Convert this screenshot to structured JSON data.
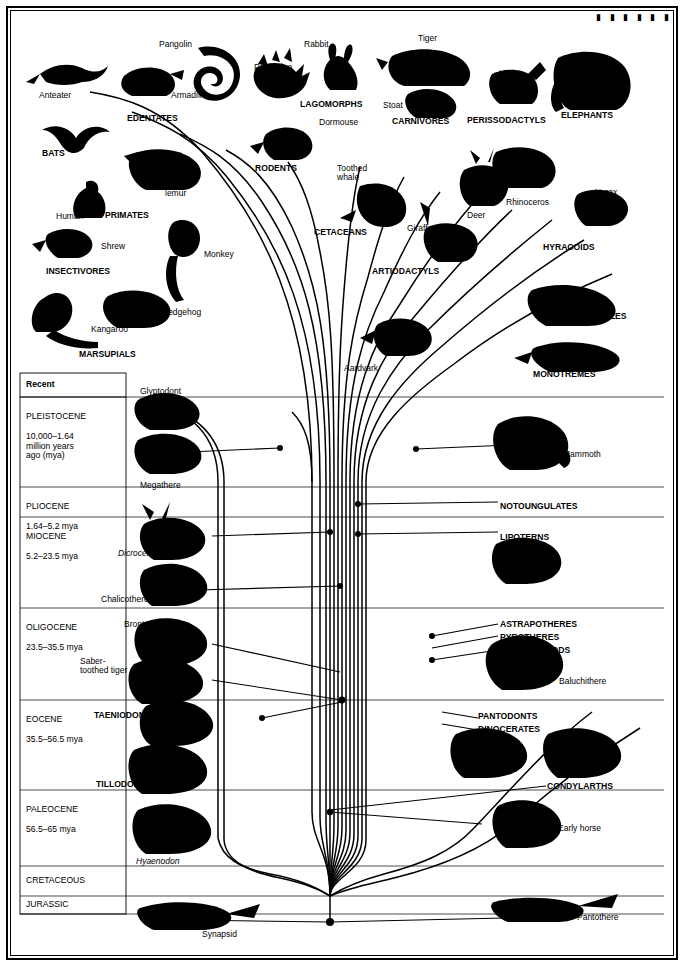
{
  "diagram": {
    "top_marks": "▮ ▮ ▮ ▮ ▮ ▮",
    "time_column": {
      "header": "Recent",
      "rows": [
        {
          "name": "PLEISTOCENE",
          "detail": "10,000–1.64\nmillion years\nago (mya)"
        },
        {
          "name": "PLIOCENE",
          "detail": "1.64–5.2 mya"
        },
        {
          "name": "MIOCENE",
          "detail": "5.2–23.5 mya"
        },
        {
          "name": "OLIGOCENE",
          "detail": "23.5–35.5 mya"
        },
        {
          "name": "EOCENE",
          "detail": "35.5–56.5 mya"
        },
        {
          "name": "PALEOCENE",
          "detail": "56.5–65 mya"
        },
        {
          "name": "CRETACEOUS",
          "detail": ""
        },
        {
          "name": "JURASSIC",
          "detail": ""
        }
      ]
    },
    "top_labels": [
      {
        "text": "Pangolin",
        "x": 147,
        "y": 28,
        "bold": false,
        "italic": false
      },
      {
        "text": "Rabbit",
        "x": 292,
        "y": 28,
        "bold": false,
        "italic": false
      },
      {
        "text": "Tiger",
        "x": 406,
        "y": 22,
        "bold": false,
        "italic": false
      },
      {
        "text": "Porcupine",
        "x": 242,
        "y": 51,
        "bold": false,
        "italic": false
      },
      {
        "text": "Horse",
        "x": 487,
        "y": 57,
        "bold": false,
        "italic": false
      },
      {
        "text": "Anteater",
        "x": 27,
        "y": 79,
        "bold": false,
        "italic": false
      },
      {
        "text": "Armadillo",
        "x": 159,
        "y": 79,
        "bold": false,
        "italic": false
      },
      {
        "text": "LAGOMORPHS",
        "x": 288,
        "y": 88,
        "bold": true,
        "italic": false
      },
      {
        "text": "Stoat",
        "x": 371,
        "y": 89,
        "bold": false,
        "italic": false
      },
      {
        "text": "ELEPHANTS",
        "x": 549,
        "y": 99,
        "bold": true,
        "italic": false
      },
      {
        "text": "EDENTATES",
        "x": 115,
        "y": 102,
        "bold": true,
        "italic": false
      },
      {
        "text": "Dormouse",
        "x": 307,
        "y": 106,
        "bold": false,
        "italic": false
      },
      {
        "text": "CARNIVORES",
        "x": 380,
        "y": 105,
        "bold": true,
        "italic": false
      },
      {
        "text": "PERISSODACTYLS",
        "x": 455,
        "y": 104,
        "bold": true,
        "italic": false
      },
      {
        "text": "BATS",
        "x": 30,
        "y": 137,
        "bold": true,
        "italic": false
      },
      {
        "text": "RODENTS",
        "x": 243,
        "y": 152,
        "bold": true,
        "italic": false
      },
      {
        "text": "Toothed\nwhale",
        "x": 325,
        "y": 152,
        "bold": false,
        "italic": false
      },
      {
        "text": "Flying\nlemur",
        "x": 153,
        "y": 168,
        "bold": false,
        "italic": false
      },
      {
        "text": "Hyrax",
        "x": 583,
        "y": 176,
        "bold": false,
        "italic": false
      },
      {
        "text": "Rhinoceros",
        "x": 494,
        "y": 186,
        "bold": false,
        "italic": false
      },
      {
        "text": "Human",
        "x": 44,
        "y": 200,
        "bold": false,
        "italic": false
      },
      {
        "text": "PRIMATES",
        "x": 93,
        "y": 199,
        "bold": true,
        "italic": false
      },
      {
        "text": "Deer",
        "x": 455,
        "y": 199,
        "bold": false,
        "italic": false
      },
      {
        "text": "CETACEANS",
        "x": 302,
        "y": 216,
        "bold": true,
        "italic": false
      },
      {
        "text": "Giraffe",
        "x": 395,
        "y": 212,
        "bold": false,
        "italic": false
      },
      {
        "text": "Shrew",
        "x": 89,
        "y": 230,
        "bold": false,
        "italic": false
      },
      {
        "text": "HYRACOIDS",
        "x": 531,
        "y": 231,
        "bold": true,
        "italic": false
      },
      {
        "text": "Monkey",
        "x": 192,
        "y": 238,
        "bold": false,
        "italic": false
      },
      {
        "text": "INSECTIVORES",
        "x": 34,
        "y": 255,
        "bold": true,
        "italic": false
      },
      {
        "text": "ARTIODACTYLS",
        "x": 360,
        "y": 255,
        "bold": true,
        "italic": false
      },
      {
        "text": "Hedgehog",
        "x": 150,
        "y": 296,
        "bold": false,
        "italic": false
      },
      {
        "text": "MANATEES",
        "x": 567,
        "y": 300,
        "bold": true,
        "italic": false
      },
      {
        "text": "Kangaroo",
        "x": 79,
        "y": 313,
        "bold": false,
        "italic": false
      },
      {
        "text": "Aardvark",
        "x": 332,
        "y": 352,
        "bold": false,
        "italic": false
      },
      {
        "text": "MARSUPIALS",
        "x": 67,
        "y": 338,
        "bold": true,
        "italic": false
      },
      {
        "text": "MONOTREMES",
        "x": 521,
        "y": 358,
        "bold": true,
        "italic": false
      }
    ],
    "chart_labels": [
      {
        "text": "Glyptodont",
        "x": 128,
        "y": 375,
        "bold": false,
        "italic": false
      },
      {
        "text": "Mammoth",
        "x": 551,
        "y": 438,
        "bold": false,
        "italic": false
      },
      {
        "text": "Megathere",
        "x": 128,
        "y": 469,
        "bold": false,
        "italic": false
      },
      {
        "text": "NOTOUNGULATES",
        "x": 488,
        "y": 490,
        "bold": true,
        "italic": false
      },
      {
        "text": "LIPOTERNS",
        "x": 488,
        "y": 521,
        "bold": true,
        "italic": false
      },
      {
        "text": "Dicroceros",
        "x": 106,
        "y": 537,
        "bold": false,
        "italic": true
      },
      {
        "text": "Chalicothere",
        "x": 89,
        "y": 583,
        "bold": false,
        "italic": false
      },
      {
        "text": "Brontothere",
        "x": 112,
        "y": 608,
        "bold": false,
        "italic": false
      },
      {
        "text": "ASTRAPOTHERES",
        "x": 488,
        "y": 608,
        "bold": true,
        "italic": false
      },
      {
        "text": "PYROTHERES",
        "x": 488,
        "y": 621,
        "bold": true,
        "italic": false
      },
      {
        "text": "EMBRITHOPODS",
        "x": 488,
        "y": 634,
        "bold": true,
        "italic": false
      },
      {
        "text": "Baluchithere",
        "x": 547,
        "y": 665,
        "bold": false,
        "italic": false
      },
      {
        "text": "Saber-\ntoothed tiger",
        "x": 68,
        "y": 645,
        "bold": false,
        "italic": false
      },
      {
        "text": "TAENIODONTS",
        "x": 82,
        "y": 699,
        "bold": true,
        "italic": false
      },
      {
        "text": "PANTODONTS",
        "x": 466,
        "y": 700,
        "bold": true,
        "italic": false
      },
      {
        "text": "DINOCERATES",
        "x": 466,
        "y": 713,
        "bold": true,
        "italic": false
      },
      {
        "text": "TILLODONTS",
        "x": 84,
        "y": 768,
        "bold": true,
        "italic": false
      },
      {
        "text": "CONDYLARTHS",
        "x": 535,
        "y": 770,
        "bold": true,
        "italic": false
      },
      {
        "text": "Early horse",
        "x": 546,
        "y": 812,
        "bold": false,
        "italic": false
      },
      {
        "text": "Hyaenodon",
        "x": 124,
        "y": 845,
        "bold": false,
        "italic": true
      },
      {
        "text": "Pantothere",
        "x": 565,
        "y": 901,
        "bold": false,
        "italic": false
      },
      {
        "text": "Synapsid",
        "x": 190,
        "y": 918,
        "bold": false,
        "italic": false
      }
    ]
  }
}
